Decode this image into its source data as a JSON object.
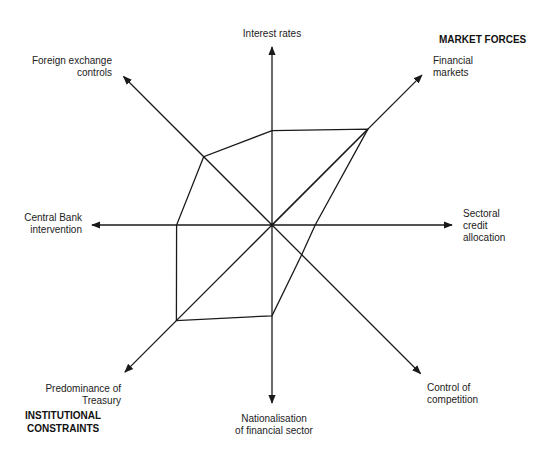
{
  "chart_data": {
    "type": "radar",
    "title": "",
    "center": [
      272,
      225
    ],
    "axes": [
      {
        "key": "interest_rates",
        "label": [
          "Interest rates"
        ],
        "angle_deg": 90,
        "length": 178,
        "value": 0.53
      },
      {
        "key": "financial_markets",
        "label": [
          "Financial",
          "markets"
        ],
        "angle_deg": 45,
        "length": 212,
        "value": 0.64
      },
      {
        "key": "sectoral_credit_allocation",
        "label": [
          "Sectoral",
          "credit",
          "allocation"
        ],
        "angle_deg": 0,
        "length": 180,
        "value": 0.24
      },
      {
        "key": "control_of_competition",
        "label": [
          "Control of",
          "competition"
        ],
        "angle_deg": -45,
        "length": 210,
        "value": 0.2
      },
      {
        "key": "nationalisation_of_financial_sector",
        "label": [
          "Nationalisation",
          "of financial sector"
        ],
        "angle_deg": -90,
        "length": 178,
        "value": 0.51
      },
      {
        "key": "predominance_of_treasury",
        "label": [
          "Predominance of",
          "Treasury"
        ],
        "angle_deg": -135,
        "length": 208,
        "value": 0.65
      },
      {
        "key": "central_bank_intervention",
        "label": [
          "Central Bank",
          "intervention"
        ],
        "angle_deg": 180,
        "length": 180,
        "value": 0.53
      },
      {
        "key": "foreign_exchange_controls",
        "label": [
          "Foreign exchange",
          "controls"
        ],
        "angle_deg": 135,
        "length": 210,
        "value": 0.46
      }
    ],
    "series": [
      {
        "name": "Profile",
        "values": [
          0.53,
          0.64,
          0.24,
          0.2,
          0.51,
          0.65,
          0.53,
          0.46
        ]
      }
    ],
    "extra_lines": [
      {
        "from": "center",
        "to": "financial_markets_vertex"
      }
    ],
    "group_labels": [
      {
        "text": "MARKET FORCES",
        "position": "top-right"
      },
      {
        "text": [
          "INSTITUTIONAL",
          "CONSTRAINTS"
        ],
        "position": "bottom-left"
      }
    ],
    "grid": false,
    "legend": "none"
  },
  "labels": {
    "interest_rates": "Interest rates",
    "financial_markets_1": "Financial",
    "financial_markets_2": "markets",
    "sectoral_1": "Sectoral",
    "sectoral_2": "credit",
    "sectoral_3": "allocation",
    "control_1": "Control of",
    "control_2": "competition",
    "nationalisation_1": "Nationalisation",
    "nationalisation_2": "of financial sector",
    "treasury_1": "Predominance of",
    "treasury_2": "Treasury",
    "central_bank_1": "Central Bank",
    "central_bank_2": "intervention",
    "fx_1": "Foreign exchange",
    "fx_2": "controls"
  },
  "groups": {
    "market_forces": "MARKET FORCES",
    "institutional_1": "INSTITUTIONAL",
    "institutional_2": "CONSTRAINTS"
  },
  "colors": {
    "ink": "#1a1a1a",
    "background": "#ffffff"
  }
}
